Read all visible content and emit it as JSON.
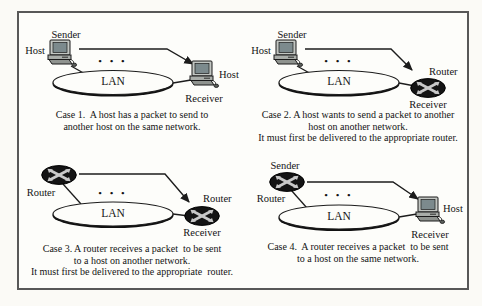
{
  "figure": {
    "lan_label": "LAN",
    "dots": "• • •",
    "colors": {
      "border": "#585858",
      "router_fill": "#141414",
      "router_cross": "#c9c9c9",
      "arrow": "#1c1c1c",
      "lan_fill": "#fdfdfa"
    },
    "cases": [
      {
        "name": "Case 1",
        "sender_type": "host",
        "receiver_type": "host",
        "sender_top_label": "Sender",
        "sender_side_label": "Host",
        "receiver_side_label": "Host",
        "receiver_bottom_label": "Receiver",
        "caption_lines": [
          "Case 1.  A host has a packet to send to",
          "another host on the same network."
        ]
      },
      {
        "name": "Case 2",
        "sender_type": "host",
        "receiver_type": "router",
        "sender_top_label": "Sender",
        "sender_side_label": "Host",
        "receiver_side_label": "Router",
        "receiver_bottom_label": "Receiver",
        "caption_lines": [
          "Case 2. A host wants to send a packet to another",
          "host on another network.",
          "It must first be delivered to the appropriate router."
        ]
      },
      {
        "name": "Case 3",
        "sender_type": "router",
        "receiver_type": "router",
        "sender_side_label": "Router",
        "receiver_side_label": "Router",
        "receiver_bottom_label": "Receiver",
        "caption_lines": [
          "Case 3. A router receives a packet  to be sent",
          "to a host on another network.",
          "It must first be delivered to the appropriate  router."
        ]
      },
      {
        "name": "Case 4",
        "sender_type": "router",
        "receiver_type": "host",
        "sender_top_label": "Sender",
        "sender_side_label": "Router",
        "receiver_side_label": "Host",
        "receiver_bottom_label": "Receiver",
        "caption_lines": [
          "Case 4.  A router receives a packet  to be sent",
          "to a host on the same network."
        ]
      }
    ]
  }
}
